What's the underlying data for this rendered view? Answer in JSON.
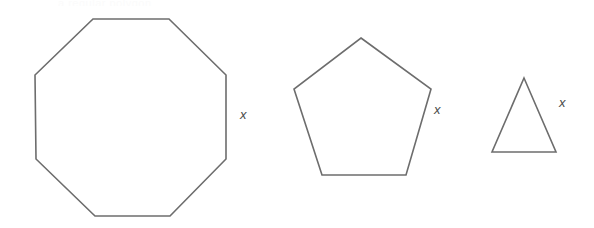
{
  "figure": {
    "kind": "geometry-diagram",
    "background_color": "#ffffff",
    "stroke_color": "#6d6d6d",
    "label_color": "#4a4a4a",
    "ghost_artifact_text": "a regular polygon",
    "shapes": [
      {
        "id": "octagon",
        "name": "regular-octagon",
        "sides": 8,
        "side_label": "x",
        "label_position": {
          "x": 240,
          "y": 108
        },
        "points": "93,19 169,19 226,75 226,159 170,216 95,216 36,159 35,75"
      },
      {
        "id": "pentagon",
        "name": "regular-pentagon",
        "sides": 5,
        "side_label": "x",
        "label_position": {
          "x": 434,
          "y": 103
        },
        "points": "361,38 431,89 406,175 322,175 294,89"
      },
      {
        "id": "triangle",
        "name": "equilateral-triangle",
        "sides": 3,
        "side_label": "x",
        "label_position": {
          "x": 559,
          "y": 96
        },
        "points": "524,78 556,152 492,152"
      }
    ]
  }
}
